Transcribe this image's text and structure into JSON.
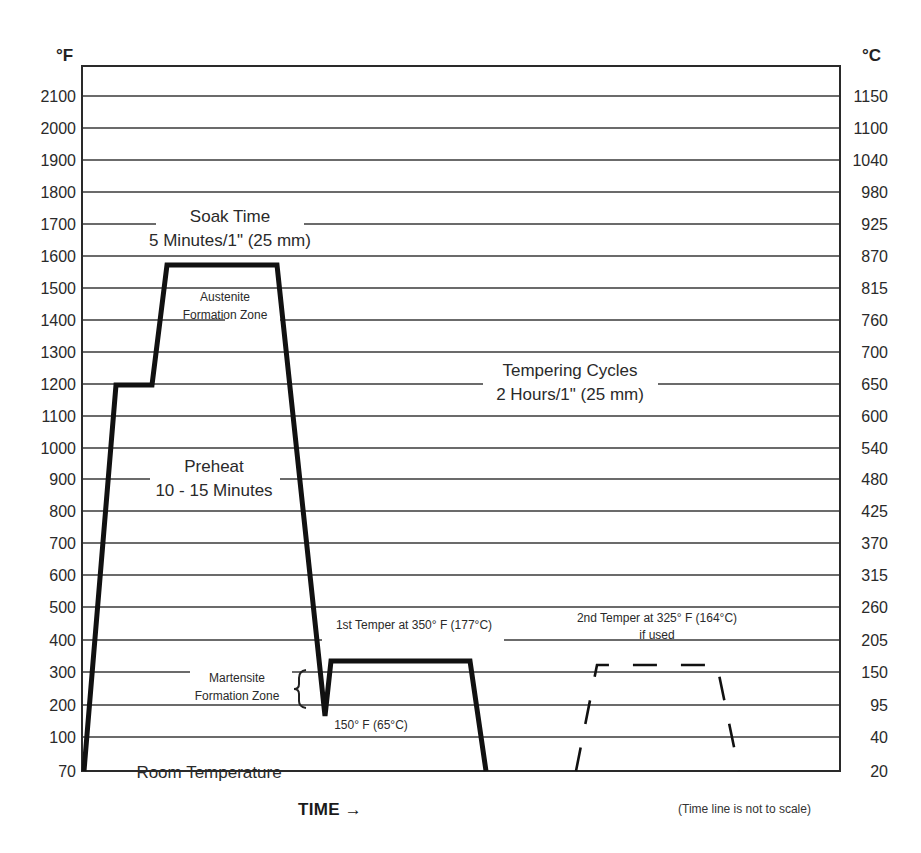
{
  "chart_data": {
    "type": "line",
    "title": "",
    "xlabel": "TIME →",
    "ylabel_left": "°F",
    "ylabel_right": "°C",
    "x_note": "(Time line is not to scale)",
    "grid": true,
    "y_ticks_f": [
      "2100",
      "2000",
      "1900",
      "1800",
      "1700",
      "1600",
      "1500",
      "1400",
      "1300",
      "1200",
      "1100",
      "1000",
      "900",
      "800",
      "700",
      "600",
      "500",
      "400",
      "300",
      "200",
      "100",
      "70"
    ],
    "y_ticks_c": [
      "1150",
      "1100",
      "1040",
      "980",
      "925",
      "870",
      "815",
      "760",
      "700",
      "650",
      "600",
      "540",
      "480",
      "425",
      "370",
      "315",
      "260",
      "205",
      "150",
      "95",
      "40",
      "20"
    ],
    "ylim_f": [
      70,
      2200
    ],
    "series": [
      {
        "name": "Heat treatment cycle",
        "style": "solid",
        "points_f": [
          {
            "stage": "Start",
            "temp_f": 70
          },
          {
            "stage": "Preheat",
            "temp_f": 1200
          },
          {
            "stage": "Preheat end",
            "temp_f": 1200
          },
          {
            "stage": "Austenitize",
            "temp_f": 1575
          },
          {
            "stage": "Soak end",
            "temp_f": 1575
          },
          {
            "stage": "Quench",
            "temp_f": 150
          },
          {
            "stage": "1st Temper",
            "temp_f": 350
          },
          {
            "stage": "1st Temper end",
            "temp_f": 350
          },
          {
            "stage": "Cool",
            "temp_f": 70
          }
        ]
      },
      {
        "name": "2nd Temper (if used)",
        "style": "dashed",
        "points_f": [
          {
            "stage": "Start",
            "temp_f": 70
          },
          {
            "stage": "2nd Temper",
            "temp_f": 325
          },
          {
            "stage": "2nd Temper end",
            "temp_f": 325
          },
          {
            "stage": "Cool",
            "temp_f": 70
          }
        ]
      }
    ],
    "annotations": {
      "soak_title": "Soak Time",
      "soak_detail": "5 Minutes/1\" (25 mm)",
      "austenite_1": "Austenite",
      "austenite_2": "Formation Zone",
      "preheat_title": "Preheat",
      "preheat_detail": "10 - 15 Minutes",
      "tempering_title": "Tempering Cycles",
      "tempering_detail": "2 Hours/1\" (25 mm)",
      "first_temper": "1st Temper at 350° F (177°C)",
      "second_temper_1": "2nd Temper at 325° F (164°C)",
      "second_temper_2": "if used",
      "martensite_1": "Martensite",
      "martensite_2": "Formation Zone",
      "quench_low": "150° F (65°C)",
      "room_temp": "Room Temperature"
    }
  }
}
